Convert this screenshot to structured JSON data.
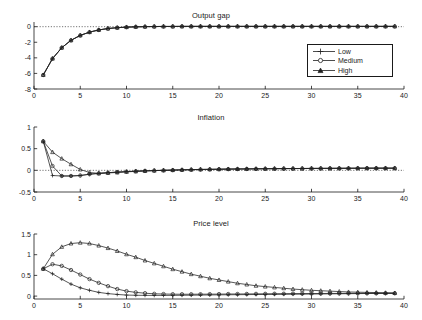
{
  "figure": {
    "panels": [
      {
        "id": "output-gap",
        "title": "Output gap",
        "xlabel": "",
        "ylabel": "",
        "xticks": [
          0,
          5,
          10,
          15,
          20,
          25,
          30,
          35,
          40
        ],
        "yticks": [
          -8,
          -6,
          -4,
          -2,
          0
        ],
        "xticklabels": [
          "0",
          "5",
          "10",
          "15",
          "20",
          "25",
          "30",
          "35",
          "40"
        ],
        "yticklabels": [
          "-8",
          "-6",
          "-4",
          "-2",
          "0"
        ],
        "xlim": [
          0,
          40
        ],
        "ylim": [
          -8,
          0.6
        ],
        "zero_line": true,
        "has_legend": true
      },
      {
        "id": "inflation",
        "title": "Inflation",
        "xlabel": "",
        "ylabel": "",
        "xticks": [
          0,
          5,
          10,
          15,
          20,
          25,
          30,
          35,
          40
        ],
        "yticks": [
          -0.5,
          0,
          0.5,
          1
        ],
        "xticklabels": [
          "0",
          "5",
          "10",
          "15",
          "20",
          "25",
          "30",
          "35",
          "40"
        ],
        "yticklabels": [
          "-0.5",
          "0",
          "0.5",
          "1"
        ],
        "xlim": [
          0,
          40
        ],
        "ylim": [
          -0.5,
          1
        ],
        "zero_line": true,
        "has_legend": false
      },
      {
        "id": "price-level",
        "title": "Price level",
        "xlabel": "",
        "ylabel": "",
        "xticks": [
          0,
          5,
          10,
          15,
          20,
          25,
          30,
          35,
          40
        ],
        "yticks": [
          0,
          0.5,
          1,
          1.5
        ],
        "xticklabels": [
          "0",
          "5",
          "10",
          "15",
          "20",
          "25",
          "30",
          "35",
          "40"
        ],
        "yticklabels": [
          "0",
          "0.5",
          "1",
          "1.5"
        ],
        "xlim": [
          0,
          40
        ],
        "ylim": [
          -0.07,
          1.5
        ],
        "zero_line": false,
        "has_legend": false
      }
    ],
    "legend": {
      "position": "upper-right-of-panel-1",
      "entries": [
        {
          "label": "Low",
          "marker": "plus"
        },
        {
          "label": "Medium",
          "marker": "circle"
        },
        {
          "label": "High",
          "marker": "triangle"
        }
      ]
    }
  },
  "chart_data": [
    {
      "type": "line",
      "title": "Output gap",
      "xlabel": "",
      "ylabel": "",
      "xlim": [
        0,
        40
      ],
      "ylim": [
        -8,
        0.6
      ],
      "grid": false,
      "legend": [
        "Low",
        "Medium",
        "High"
      ],
      "x": [
        1,
        2,
        3,
        4,
        5,
        6,
        7,
        8,
        9,
        10,
        11,
        12,
        13,
        14,
        15,
        16,
        17,
        18,
        19,
        20,
        21,
        22,
        23,
        24,
        25,
        26,
        27,
        28,
        29,
        30,
        31,
        32,
        33,
        34,
        35,
        36,
        37,
        38,
        39
      ],
      "series": [
        {
          "name": "Low",
          "marker": "plus",
          "values": [
            -6.2,
            -4.1,
            -2.7,
            -1.75,
            -1.12,
            -0.7,
            -0.42,
            -0.24,
            -0.13,
            -0.06,
            -0.02,
            0.0,
            0.02,
            0.03,
            0.03,
            0.04,
            0.04,
            0.04,
            0.04,
            0.04,
            0.04,
            0.04,
            0.04,
            0.04,
            0.04,
            0.04,
            0.04,
            0.04,
            0.04,
            0.04,
            0.04,
            0.04,
            0.04,
            0.04,
            0.04,
            0.04,
            0.04,
            0.04,
            0.04
          ]
        },
        {
          "name": "Medium",
          "marker": "circle",
          "values": [
            -6.2,
            -4.1,
            -2.7,
            -1.75,
            -1.12,
            -0.7,
            -0.42,
            -0.24,
            -0.13,
            -0.06,
            -0.02,
            0.0,
            0.02,
            0.03,
            0.03,
            0.04,
            0.04,
            0.04,
            0.04,
            0.04,
            0.04,
            0.04,
            0.04,
            0.04,
            0.04,
            0.04,
            0.04,
            0.04,
            0.04,
            0.04,
            0.04,
            0.04,
            0.04,
            0.04,
            0.04,
            0.04,
            0.04,
            0.04,
            0.04
          ]
        },
        {
          "name": "High",
          "marker": "triangle",
          "values": [
            -6.2,
            -4.1,
            -2.7,
            -1.75,
            -1.12,
            -0.7,
            -0.42,
            -0.24,
            -0.13,
            -0.06,
            -0.02,
            0.0,
            0.02,
            0.03,
            0.03,
            0.04,
            0.04,
            0.04,
            0.04,
            0.04,
            0.04,
            0.04,
            0.04,
            0.04,
            0.04,
            0.04,
            0.04,
            0.04,
            0.04,
            0.04,
            0.04,
            0.04,
            0.04,
            0.04,
            0.04,
            0.04,
            0.04,
            0.04,
            0.04
          ]
        }
      ]
    },
    {
      "type": "line",
      "title": "Inflation",
      "xlabel": "",
      "ylabel": "",
      "xlim": [
        0,
        40
      ],
      "ylim": [
        -0.5,
        1
      ],
      "grid": false,
      "legend": [
        "Low",
        "Medium",
        "High"
      ],
      "x": [
        1,
        2,
        3,
        4,
        5,
        6,
        7,
        8,
        9,
        10,
        11,
        12,
        13,
        14,
        15,
        16,
        17,
        18,
        19,
        20,
        21,
        22,
        23,
        24,
        25,
        26,
        27,
        28,
        29,
        30,
        31,
        32,
        33,
        34,
        35,
        36,
        37,
        38,
        39
      ],
      "series": [
        {
          "name": "Low",
          "marker": "plus",
          "values": [
            0.67,
            -0.12,
            -0.13,
            -0.13,
            -0.12,
            -0.09,
            -0.07,
            -0.055,
            -0.04,
            -0.03,
            -0.02,
            -0.012,
            -0.005,
            0.0,
            0.005,
            0.01,
            0.015,
            0.02,
            0.022,
            0.025,
            0.028,
            0.03,
            0.032,
            0.034,
            0.036,
            0.038,
            0.04,
            0.04,
            0.042,
            0.044,
            0.045,
            0.046,
            0.047,
            0.048,
            0.049,
            0.05,
            0.05,
            0.05,
            0.05
          ]
        },
        {
          "name": "Medium",
          "marker": "circle",
          "values": [
            0.67,
            0.1,
            -0.13,
            -0.13,
            -0.12,
            -0.09,
            -0.07,
            -0.055,
            -0.04,
            -0.03,
            -0.02,
            -0.012,
            -0.005,
            0.0,
            0.005,
            0.01,
            0.015,
            0.02,
            0.022,
            0.025,
            0.028,
            0.03,
            0.032,
            0.034,
            0.036,
            0.038,
            0.04,
            0.04,
            0.042,
            0.044,
            0.045,
            0.046,
            0.047,
            0.048,
            0.049,
            0.05,
            0.05,
            0.05,
            0.05
          ]
        },
        {
          "name": "High",
          "marker": "triangle",
          "values": [
            0.67,
            0.42,
            0.27,
            0.14,
            0.02,
            -0.05,
            -0.07,
            -0.06,
            -0.05,
            -0.035,
            -0.025,
            -0.015,
            -0.007,
            0.0,
            0.006,
            0.012,
            0.017,
            0.021,
            0.024,
            0.027,
            0.03,
            0.032,
            0.034,
            0.036,
            0.038,
            0.04,
            0.041,
            0.042,
            0.043,
            0.044,
            0.045,
            0.046,
            0.047,
            0.048,
            0.049,
            0.05,
            0.05,
            0.05,
            0.05
          ]
        }
      ]
    },
    {
      "type": "line",
      "title": "Price level",
      "xlabel": "",
      "ylabel": "",
      "xlim": [
        0,
        40
      ],
      "ylim": [
        -0.07,
        1.5
      ],
      "grid": false,
      "legend": [
        "Low",
        "Medium",
        "High"
      ],
      "x": [
        1,
        2,
        3,
        4,
        5,
        6,
        7,
        8,
        9,
        10,
        11,
        12,
        13,
        14,
        15,
        16,
        17,
        18,
        19,
        20,
        21,
        22,
        23,
        24,
        25,
        26,
        27,
        28,
        29,
        30,
        31,
        32,
        33,
        34,
        35,
        36,
        37,
        38,
        39
      ],
      "series": [
        {
          "name": "Low",
          "marker": "plus",
          "values": [
            0.66,
            0.54,
            0.41,
            0.29,
            0.2,
            0.14,
            0.09,
            0.06,
            0.04,
            0.025,
            0.02,
            0.018,
            0.017,
            0.017,
            0.018,
            0.02,
            0.022,
            0.025,
            0.028,
            0.03,
            0.032,
            0.034,
            0.036,
            0.038,
            0.04,
            0.042,
            0.044,
            0.046,
            0.048,
            0.05,
            0.052,
            0.054,
            0.056,
            0.058,
            0.06,
            0.062,
            0.064,
            0.066,
            0.068
          ]
        },
        {
          "name": "Medium",
          "marker": "circle",
          "values": [
            0.66,
            0.77,
            0.73,
            0.63,
            0.52,
            0.41,
            0.32,
            0.24,
            0.17,
            0.12,
            0.09,
            0.07,
            0.055,
            0.05,
            0.046,
            0.045,
            0.045,
            0.046,
            0.047,
            0.048,
            0.05,
            0.051,
            0.052,
            0.054,
            0.055,
            0.057,
            0.058,
            0.06,
            0.061,
            0.062,
            0.063,
            0.064,
            0.065,
            0.066,
            0.067,
            0.068,
            0.068,
            0.069,
            0.069
          ]
        },
        {
          "name": "High",
          "marker": "triangle",
          "values": [
            0.66,
            1.01,
            1.19,
            1.27,
            1.29,
            1.27,
            1.22,
            1.16,
            1.09,
            1.01,
            0.94,
            0.86,
            0.79,
            0.72,
            0.65,
            0.59,
            0.53,
            0.48,
            0.43,
            0.39,
            0.35,
            0.31,
            0.28,
            0.25,
            0.23,
            0.21,
            0.19,
            0.17,
            0.155,
            0.14,
            0.13,
            0.12,
            0.11,
            0.1,
            0.095,
            0.09,
            0.085,
            0.08,
            0.075
          ]
        }
      ]
    }
  ]
}
